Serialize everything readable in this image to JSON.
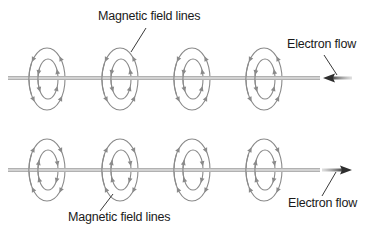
{
  "diagram": {
    "colors": {
      "background": "#ffffff",
      "wire": "#c4c4c4",
      "wire_edge": "#9a9a9a",
      "field_line": "#8a8a8a",
      "arrow": "#3a3a3a",
      "text": "#1a1a1a"
    },
    "panels": [
      {
        "id": "top",
        "wire_y": 78,
        "electron_flow_direction": "left",
        "field_direction": "counterclockwise-front-up-right",
        "labels": {
          "field_lines": "Magnetic field lines",
          "electron_flow": "Electron flow"
        }
      },
      {
        "id": "bottom",
        "wire_y": 170,
        "electron_flow_direction": "right",
        "field_direction": "clockwise-front-up-left",
        "labels": {
          "field_lines": "Magnetic field lines",
          "electron_flow": "Electron flow"
        }
      }
    ],
    "ring_centers_x": [
      47,
      120,
      192,
      264
    ],
    "ring_count_per_wire": 4,
    "outer_ring": {
      "rx": 18,
      "ry": 31
    },
    "inner_ring": {
      "rx": 10,
      "ry": 20
    }
  }
}
